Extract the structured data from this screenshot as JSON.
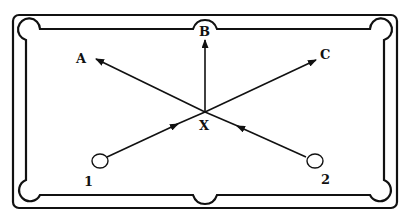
{
  "diagram": {
    "labels": {
      "A": "A",
      "B": "B",
      "C": "C",
      "X": "X",
      "ball_1": "1",
      "ball_2": "2"
    },
    "paths": [
      {
        "from": "X",
        "to": "A",
        "arrow": "at A"
      },
      {
        "from": "X",
        "to": "B",
        "arrow": "at B"
      },
      {
        "from": "X",
        "to": "C",
        "arrow": "at C"
      },
      {
        "from": "ball_1",
        "to": "X",
        "arrow": "midway toward X"
      },
      {
        "from": "ball_2",
        "to": "X",
        "arrow": "midway toward X"
      }
    ],
    "pockets": [
      "top-left",
      "top-center",
      "top-right",
      "bottom-left",
      "bottom-center",
      "bottom-right"
    ],
    "colors": {
      "ink": "#111111",
      "background": "#ffffff"
    }
  }
}
